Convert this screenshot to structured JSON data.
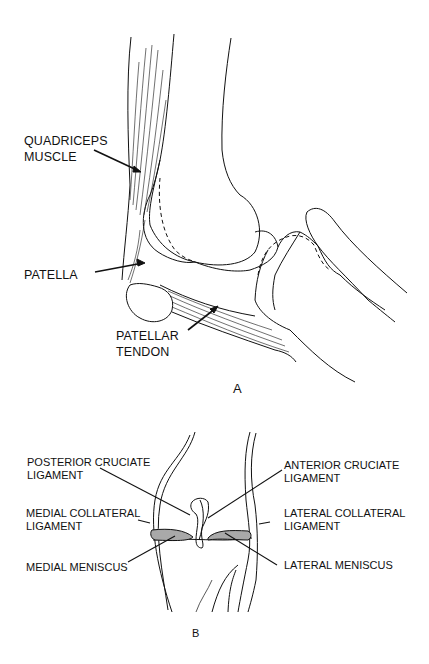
{
  "figure_a": {
    "caption": "A",
    "labels": {
      "quadriceps_1": "QUADRICEPS",
      "quadriceps_2": "MUSCLE",
      "patella": "PATELLA",
      "patellar_tendon_1": "PATELLAR",
      "patellar_tendon_2": "TENDON"
    }
  },
  "figure_b": {
    "caption": "B",
    "labels": {
      "pcl_1": "POSTERIOR CRUCIATE",
      "pcl_2": "LIGAMENT",
      "acl_1": "ANTERIOR CRUCIATE",
      "acl_2": "LIGAMENT",
      "mcl_1": "MEDIAL COLLATERAL",
      "mcl_2": "LIGAMENT",
      "lcl_1": "LATERAL COLLATERAL",
      "lcl_2": "LIGAMENT",
      "medial_meniscus": "MEDIAL MENISCUS",
      "lateral_meniscus": "LATERAL MENISCUS"
    }
  },
  "colors": {
    "line": "#111111",
    "meniscus": "#a9a9a9",
    "background": "#ffffff"
  }
}
